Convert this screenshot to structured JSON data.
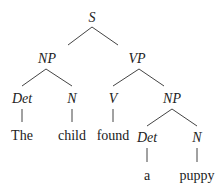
{
  "diagram": {
    "type": "syntax-tree",
    "colors": {
      "text": "#222222",
      "edge": "#444444",
      "background": "#ffffff"
    },
    "nodes": [
      {
        "id": "S",
        "label": "S",
        "kind": "category",
        "x": 92,
        "y": 22
      },
      {
        "id": "NP1",
        "label": "NP",
        "kind": "category",
        "x": 47,
        "y": 63
      },
      {
        "id": "VP",
        "label": "VP",
        "kind": "category",
        "x": 137,
        "y": 63
      },
      {
        "id": "Det1",
        "label": "Det",
        "kind": "category",
        "x": 22,
        "y": 103
      },
      {
        "id": "N1",
        "label": "N",
        "kind": "category",
        "x": 72,
        "y": 103
      },
      {
        "id": "V",
        "label": "V",
        "kind": "category",
        "x": 113,
        "y": 103
      },
      {
        "id": "NP2",
        "label": "NP",
        "kind": "category",
        "x": 172,
        "y": 103
      },
      {
        "id": "w1",
        "label": "The",
        "kind": "word",
        "x": 22,
        "y": 140
      },
      {
        "id": "w2",
        "label": "child",
        "kind": "word",
        "x": 72,
        "y": 140
      },
      {
        "id": "w3",
        "label": "found",
        "kind": "word",
        "x": 113,
        "y": 140
      },
      {
        "id": "Det2",
        "label": "Det",
        "kind": "category",
        "x": 147,
        "y": 142
      },
      {
        "id": "N2",
        "label": "N",
        "kind": "category",
        "x": 197,
        "y": 142
      },
      {
        "id": "w4",
        "label": "a",
        "kind": "word",
        "x": 147,
        "y": 180
      },
      {
        "id": "w5",
        "label": "puppy",
        "kind": "word",
        "x": 197,
        "y": 180
      }
    ],
    "edges": [
      {
        "from": "S",
        "to": "NP1",
        "x1": 92,
        "y1": 27,
        "x2": 68,
        "y2": 45
      },
      {
        "from": "S",
        "to": "VP",
        "x1": 92,
        "y1": 27,
        "x2": 118,
        "y2": 45
      },
      {
        "from": "NP1",
        "to": "Det1",
        "x1": 46,
        "y1": 69,
        "x2": 22,
        "y2": 86
      },
      {
        "from": "NP1",
        "to": "N1",
        "x1": 46,
        "y1": 69,
        "x2": 72,
        "y2": 86
      },
      {
        "from": "VP",
        "to": "V",
        "x1": 139,
        "y1": 69,
        "x2": 113,
        "y2": 86
      },
      {
        "from": "VP",
        "to": "NP2",
        "x1": 139,
        "y1": 69,
        "x2": 164,
        "y2": 86
      },
      {
        "from": "Det1",
        "to": "w1",
        "x1": 22,
        "y1": 109,
        "x2": 22,
        "y2": 122
      },
      {
        "from": "N1",
        "to": "w2",
        "x1": 72,
        "y1": 109,
        "x2": 72,
        "y2": 122
      },
      {
        "from": "V",
        "to": "w3",
        "x1": 113,
        "y1": 109,
        "x2": 113,
        "y2": 122
      },
      {
        "from": "NP2",
        "to": "Det2",
        "x1": 172,
        "y1": 109,
        "x2": 147,
        "y2": 126
      },
      {
        "from": "NP2",
        "to": "N2",
        "x1": 172,
        "y1": 109,
        "x2": 197,
        "y2": 126
      },
      {
        "from": "Det2",
        "to": "w4",
        "x1": 147,
        "y1": 148,
        "x2": 147,
        "y2": 162
      },
      {
        "from": "N2",
        "to": "w5",
        "x1": 197,
        "y1": 148,
        "x2": 197,
        "y2": 162
      }
    ]
  }
}
